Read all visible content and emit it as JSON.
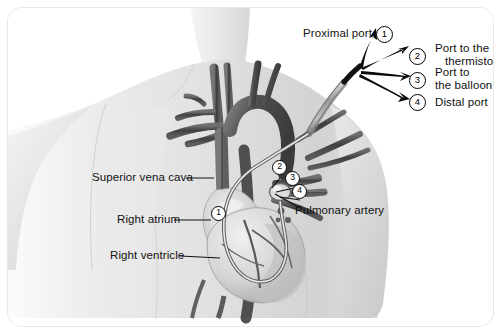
{
  "figure": {
    "type": "medical-illustration",
    "background_color": "#ffffff",
    "border_radius_px": 14
  },
  "callouts_right": [
    {
      "number": "1",
      "label": "Proximal port",
      "label_lines": [
        "Proximal port"
      ],
      "circle": {
        "x": 376,
        "y": 26
      }
    },
    {
      "number": "2",
      "label": "Port to the thermistor",
      "label_lines": [
        "Port to the",
        "thermistor"
      ],
      "circle": {
        "x": 409,
        "y": 48
      }
    },
    {
      "number": "3",
      "label": "Port to the balloon",
      "label_lines": [
        "Port to",
        "the balloon"
      ],
      "circle": {
        "x": 409,
        "y": 72
      }
    },
    {
      "number": "4",
      "label": "Distal port",
      "label_lines": [
        "Distal port"
      ],
      "circle": {
        "x": 409,
        "y": 94
      }
    }
  ],
  "callouts_anatomy": [
    {
      "number": "1",
      "label": "Right atrium",
      "circle": {
        "x": 218,
        "y": 213
      }
    },
    {
      "number": "2",
      "label": "",
      "circle": {
        "x": 279,
        "y": 167
      }
    },
    {
      "number": "3",
      "label": "",
      "circle": {
        "x": 292,
        "y": 178
      }
    },
    {
      "number": "4",
      "label": "",
      "circle": {
        "x": 299,
        "y": 191
      }
    }
  ],
  "anatomy_labels": [
    {
      "text": "Superior vena cava",
      "x": 92,
      "y": 170
    },
    {
      "text": "Right atrium",
      "x": 117,
      "y": 212
    },
    {
      "text": "Right ventricle",
      "x": 110,
      "y": 248
    },
    {
      "text": "Pulmonary artery",
      "x": 295,
      "y": 204
    }
  ],
  "colors": {
    "ink": "#111111",
    "skin_light": "#f2f2f2",
    "skin_mid": "#dcdcdc",
    "skin_shade": "#c6c6c6",
    "vessel_dark": "#4a4a4a",
    "vessel_mid": "#6e6e6e",
    "heart_light": "#e6e6e6",
    "heart_mid": "#b5b5b5",
    "catheter": "#8a8a8a",
    "card_border": "#e9e9e9"
  }
}
